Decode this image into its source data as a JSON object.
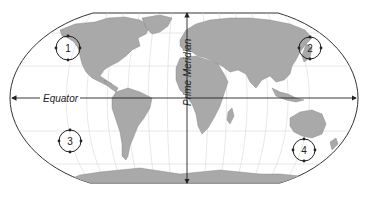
{
  "map": {
    "projection": "Robinson-like world map",
    "colors": {
      "land": "#a9a9a9",
      "ocean": "#ffffff",
      "graticule": "#d6d6d6",
      "annotation": "#222222"
    },
    "reference_lines": {
      "equator": {
        "label": "Equator"
      },
      "prime_meridian": {
        "label": "Prime Meridian"
      }
    },
    "markers": [
      {
        "id": 1,
        "label": "1",
        "location": "North Pacific off western North America"
      },
      {
        "id": 2,
        "label": "2",
        "location": "Northwest Pacific off East Asia"
      },
      {
        "id": 3,
        "label": "3",
        "location": "South Pacific west of South America"
      },
      {
        "id": 4,
        "label": "4",
        "location": "Southern Ocean south of Australia"
      }
    ]
  }
}
